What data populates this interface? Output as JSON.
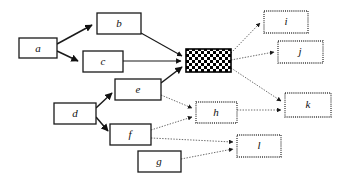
{
  "diagram": {
    "type": "directed-graph",
    "nodes": [
      {
        "id": "a",
        "label": "a",
        "x": 19,
        "y": 38,
        "w": 38,
        "h": 20,
        "style": "solid"
      },
      {
        "id": "b",
        "label": "b",
        "x": 97,
        "y": 13,
        "w": 44,
        "h": 21,
        "style": "solid"
      },
      {
        "id": "c",
        "label": "c",
        "x": 83,
        "y": 51,
        "w": 40,
        "h": 21,
        "style": "solid"
      },
      {
        "id": "d",
        "label": "d",
        "x": 54,
        "y": 103,
        "w": 42,
        "h": 21,
        "style": "solid"
      },
      {
        "id": "e",
        "label": "e",
        "x": 115,
        "y": 79,
        "w": 46,
        "h": 21,
        "style": "solid"
      },
      {
        "id": "f",
        "label": "f",
        "x": 110,
        "y": 124,
        "w": 41,
        "h": 21,
        "style": "solid"
      },
      {
        "id": "g",
        "label": "g",
        "x": 138,
        "y": 151,
        "w": 43,
        "h": 21,
        "style": "solid"
      },
      {
        "id": "center",
        "label": "",
        "x": 186,
        "y": 49,
        "w": 45,
        "h": 23,
        "style": "checkered"
      },
      {
        "id": "h",
        "label": "h",
        "x": 196,
        "y": 102,
        "w": 41,
        "h": 21,
        "style": "dotted"
      },
      {
        "id": "i",
        "label": "i",
        "x": 264,
        "y": 11,
        "w": 44,
        "h": 22,
        "style": "dotted"
      },
      {
        "id": "j",
        "label": "j",
        "x": 278,
        "y": 41,
        "w": 45,
        "h": 22,
        "style": "dotted"
      },
      {
        "id": "k",
        "label": "k",
        "x": 285,
        "y": 93,
        "w": 46,
        "h": 24,
        "style": "dotted"
      },
      {
        "id": "l",
        "label": "l",
        "x": 237,
        "y": 135,
        "w": 44,
        "h": 22,
        "style": "dotted"
      }
    ],
    "edges": [
      {
        "from": "a",
        "to": "b",
        "style": "solid"
      },
      {
        "from": "a",
        "to": "c",
        "style": "solid"
      },
      {
        "from": "b",
        "to": "center",
        "style": "solid"
      },
      {
        "from": "c",
        "to": "center",
        "style": "solid"
      },
      {
        "from": "e",
        "to": "center",
        "style": "solid"
      },
      {
        "from": "d",
        "to": "e",
        "style": "solid"
      },
      {
        "from": "d",
        "to": "f",
        "style": "solid"
      },
      {
        "from": "e",
        "to": "h",
        "style": "dotted"
      },
      {
        "from": "f",
        "to": "h",
        "style": "dotted"
      },
      {
        "from": "center",
        "to": "i",
        "style": "dotted"
      },
      {
        "from": "center",
        "to": "j",
        "style": "dotted"
      },
      {
        "from": "center",
        "to": "k",
        "style": "dotted"
      },
      {
        "from": "h",
        "to": "k",
        "style": "dotted"
      },
      {
        "from": "f",
        "to": "l",
        "style": "dotted"
      },
      {
        "from": "g",
        "to": "l",
        "style": "dotted"
      }
    ]
  }
}
